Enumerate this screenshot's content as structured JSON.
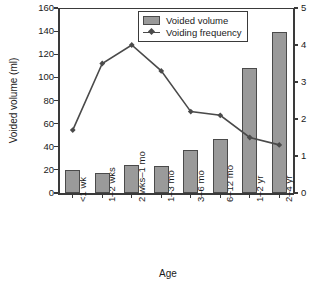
{
  "chart_data": {
    "type": "bar",
    "title": "",
    "xlabel": "Age",
    "ylabel": "Voided volume (ml)",
    "y2label": "Voiding frequency (per 8 hours)",
    "categories": [
      "<1 wk",
      "1–2 wks",
      "2 wks–1 mo",
      "1–3 mo",
      "3–6 mo",
      "6–12 mo",
      "1–2 yr",
      "2–4 yr"
    ],
    "ylim": [
      0,
      160
    ],
    "yticks": [
      0,
      20,
      40,
      60,
      80,
      100,
      120,
      140,
      160
    ],
    "y2lim": [
      0,
      5
    ],
    "y2ticks": [
      0,
      1,
      2,
      3,
      4,
      5
    ],
    "grid": false,
    "legend_position": "top-center",
    "series": [
      {
        "name": "Voided volume",
        "type": "bar",
        "axis": "left",
        "unit": "ml",
        "color": "#9a9a9a",
        "edge_color": "#4a4a4a",
        "values": [
          20,
          17.5,
          24,
          23.5,
          37,
          47,
          108,
          139
        ]
      },
      {
        "name": "Voiding frequency",
        "type": "line",
        "axis": "right",
        "unit": "per 8 hours",
        "color": "#4a4a4a",
        "marker": "diamond",
        "values": [
          1.7,
          3.5,
          4.0,
          3.3,
          2.2,
          2.1,
          1.5,
          1.3
        ]
      }
    ]
  },
  "legend": {
    "items": [
      {
        "label": "Voided volume"
      },
      {
        "label": "Voiding frequency"
      }
    ]
  }
}
